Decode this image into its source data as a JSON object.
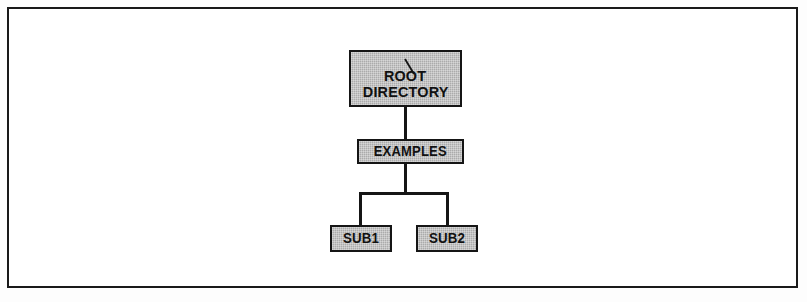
{
  "figure": {
    "kind": "directory-tree-diagram",
    "frame": {
      "border_color": "#151515",
      "background_color": "#ffffff"
    },
    "style": {
      "node_fill": "#b4b4b4",
      "node_border": "#151515",
      "connector_color": "#151515",
      "text_color": "#111111"
    }
  },
  "tree": {
    "root": {
      "name": "root-directory-node",
      "slash_glyph": "\\",
      "lines": [
        "ROOT",
        "DIRECTORY"
      ]
    },
    "level2": {
      "name": "examples-node",
      "label": "EXAMPLES"
    },
    "level3": [
      {
        "name": "sub1-node",
        "label": "SUB1"
      },
      {
        "name": "sub2-node",
        "label": "SUB2"
      }
    ]
  },
  "connectors": [
    {
      "name": "root-to-examples",
      "from": "ROOT DIRECTORY",
      "to": "EXAMPLES"
    },
    {
      "name": "examples-to-bus",
      "from": "EXAMPLES",
      "to": "branch-bus"
    },
    {
      "name": "bus-to-sub1",
      "from": "branch-bus",
      "to": "SUB1"
    },
    {
      "name": "bus-to-sub2",
      "from": "branch-bus",
      "to": "SUB2"
    }
  ]
}
